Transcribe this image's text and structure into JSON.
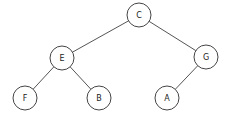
{
  "diagram": {
    "type": "binary-tree",
    "nodes": [
      {
        "id": "C",
        "label": "C",
        "x": 139,
        "y": 15
      },
      {
        "id": "E",
        "label": "E",
        "x": 62,
        "y": 58
      },
      {
        "id": "G",
        "label": "G",
        "x": 206,
        "y": 57
      },
      {
        "id": "F",
        "label": "F",
        "x": 25,
        "y": 98
      },
      {
        "id": "B",
        "label": "B",
        "x": 99,
        "y": 98
      },
      {
        "id": "A",
        "label": "A",
        "x": 167,
        "y": 98
      }
    ],
    "edges": [
      {
        "from": "C",
        "to": "E"
      },
      {
        "from": "C",
        "to": "G"
      },
      {
        "from": "E",
        "to": "F"
      },
      {
        "from": "E",
        "to": "B"
      },
      {
        "from": "G",
        "to": "A"
      }
    ]
  }
}
